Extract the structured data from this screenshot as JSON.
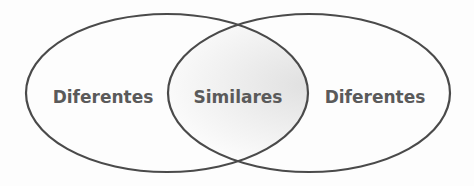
{
  "diagram": {
    "type": "venn",
    "sets": [
      {
        "label": "Diferentes",
        "position": "left"
      },
      {
        "label": "Similares",
        "position": "intersection"
      },
      {
        "label": "Diferentes",
        "position": "right"
      }
    ],
    "colors": {
      "stroke": "#4a4a4a",
      "text": "#5a5a5a",
      "intersection_shade": "#d9d9d9"
    }
  }
}
